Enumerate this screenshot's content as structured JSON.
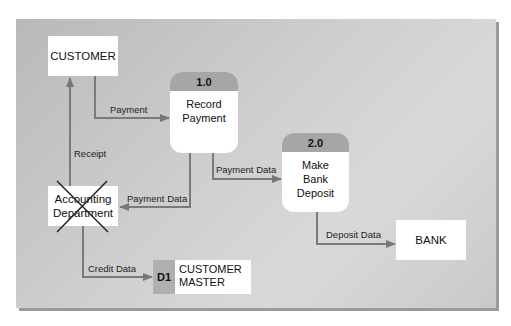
{
  "diagram": {
    "type": "data-flow-diagram",
    "colors": {
      "background": "#c8c8c8",
      "flow_line": "#777777",
      "process_header": "#a6a6a6",
      "store_id": "#b0b0b0",
      "entity_fill": "#ffffff"
    },
    "entities": [
      {
        "id": "customer",
        "label": "CUSTOMER"
      },
      {
        "id": "accounting",
        "label": "Accounting\nDepartment",
        "crossed_out": true
      },
      {
        "id": "bank",
        "label": "BANK"
      }
    ],
    "processes": [
      {
        "id": "p1",
        "number": "1.0",
        "label": "Record\nPayment"
      },
      {
        "id": "p2",
        "number": "2.0",
        "label": "Make\nBank\nDeposit"
      }
    ],
    "data_stores": [
      {
        "id": "d1",
        "number": "D1",
        "label": "CUSTOMER\nMASTER"
      }
    ],
    "flows": [
      {
        "from": "customer",
        "to": "p1",
        "label": "Payment"
      },
      {
        "from": "accounting",
        "to": "customer",
        "label": "Receipt"
      },
      {
        "from": "p1",
        "to": "accounting",
        "label": "Payment Data"
      },
      {
        "from": "p1",
        "to": "p2",
        "label": "Payment Data"
      },
      {
        "from": "p2",
        "to": "bank",
        "label": "Deposit Data"
      },
      {
        "from": "accounting",
        "to": "d1",
        "label": "Credit Data"
      }
    ]
  }
}
